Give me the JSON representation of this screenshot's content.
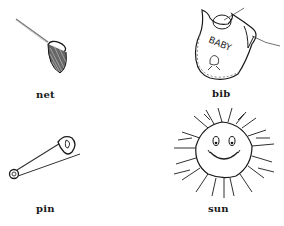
{
  "worksheet": {
    "items": [
      {
        "word": "net",
        "icon": "net-icon"
      },
      {
        "word": "bib",
        "icon": "bib-icon",
        "printed_text": "BABY"
      },
      {
        "word": "pin",
        "icon": "safety-pin-icon"
      },
      {
        "word": "sun",
        "icon": "sun-icon"
      }
    ]
  },
  "colors": {
    "background": "#ffffff",
    "ink": "#1a1a1a"
  }
}
